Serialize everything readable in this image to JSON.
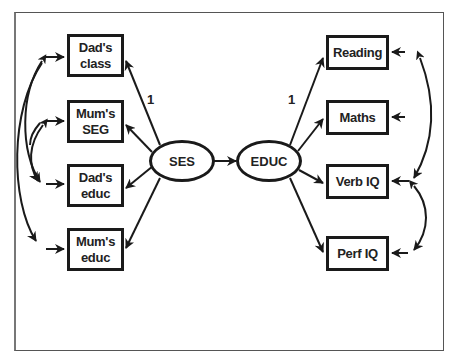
{
  "diagram": {
    "type": "structural equation model path diagram",
    "latent_variables": [
      {
        "id": "ses",
        "label": "SES"
      },
      {
        "id": "educ",
        "label": "EDUC"
      }
    ],
    "observed_left": [
      {
        "id": "dads_class",
        "line1": "Dad's",
        "line2": "class"
      },
      {
        "id": "mums_seg",
        "line1": "Mum's",
        "line2": "SEG"
      },
      {
        "id": "dads_educ",
        "line1": "Dad's",
        "line2": "educ"
      },
      {
        "id": "mums_educ",
        "line1": "Mum's",
        "line2": "educ"
      }
    ],
    "observed_right": [
      {
        "id": "reading",
        "label": "Reading"
      },
      {
        "id": "maths",
        "label": "Maths"
      },
      {
        "id": "verb_iq",
        "label": "Verb IQ"
      },
      {
        "id": "perf_iq",
        "label": "Perf IQ"
      }
    ],
    "path_labels": {
      "ses_to_dads_class": "1",
      "educ_to_reading": "1"
    },
    "edges": [
      {
        "from": "SES",
        "to": "Dad's class",
        "label": "1"
      },
      {
        "from": "SES",
        "to": "Mum's SEG"
      },
      {
        "from": "SES",
        "to": "Dad's educ"
      },
      {
        "from": "SES",
        "to": "Mum's educ"
      },
      {
        "from": "SES",
        "to": "EDUC"
      },
      {
        "from": "EDUC",
        "to": "Reading",
        "label": "1"
      },
      {
        "from": "EDUC",
        "to": "Maths"
      },
      {
        "from": "EDUC",
        "to": "Verb IQ"
      },
      {
        "from": "EDUC",
        "to": "Perf IQ"
      }
    ],
    "correlated_errors": [
      [
        "Dad's class",
        "Dad's educ"
      ],
      [
        "Mum's SEG",
        "Dad's educ"
      ],
      [
        "Dad's class",
        "Mum's educ"
      ],
      [
        "Reading",
        "Verb IQ"
      ],
      [
        "Verb IQ",
        "Perf IQ"
      ]
    ],
    "colors": {
      "stroke": "#1a1a1a",
      "background": "#ffffff",
      "frame": "#555555"
    }
  }
}
